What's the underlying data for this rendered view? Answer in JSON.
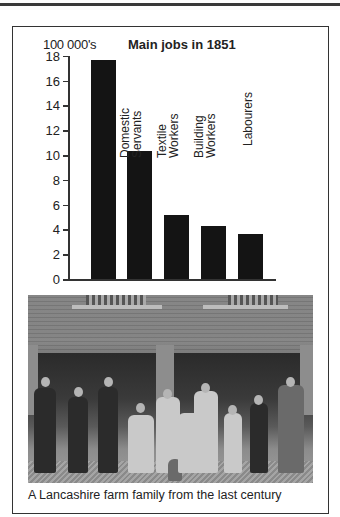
{
  "chart_data": {
    "type": "bar",
    "title": "Main jobs in 1851",
    "ylabel": "100 000's",
    "xlabel": "",
    "categories": [
      "",
      "Domestic Servants",
      "Textile Workers",
      "Building Workers",
      "Labourers"
    ],
    "values": [
      17.7,
      10.3,
      5.2,
      4.3,
      3.6
    ],
    "ylim": [
      0,
      18
    ],
    "yticks": [
      0,
      2,
      4,
      6,
      8,
      10,
      12,
      14,
      16,
      18
    ],
    "grid": false,
    "legend": "none",
    "bar_color": "#141414"
  },
  "chart": {
    "title": "Main jobs in 1851",
    "unit_label": "100 000's",
    "ticks": [
      "0",
      "2",
      "4",
      "6",
      "8",
      "10",
      "12",
      "14",
      "16",
      "18"
    ],
    "labels": [
      {
        "line1": "Domestic",
        "line2": "Servants"
      },
      {
        "line1": "Textile",
        "line2": "Workers"
      },
      {
        "line1": "Building",
        "line2": "Workers"
      },
      {
        "line1": "Labourers",
        "line2": ""
      }
    ]
  },
  "photo": {
    "alt": "Black and white photograph of a farm family posed in front of a brick farmhouse"
  },
  "caption": "A Lancashire farm family from the last century"
}
